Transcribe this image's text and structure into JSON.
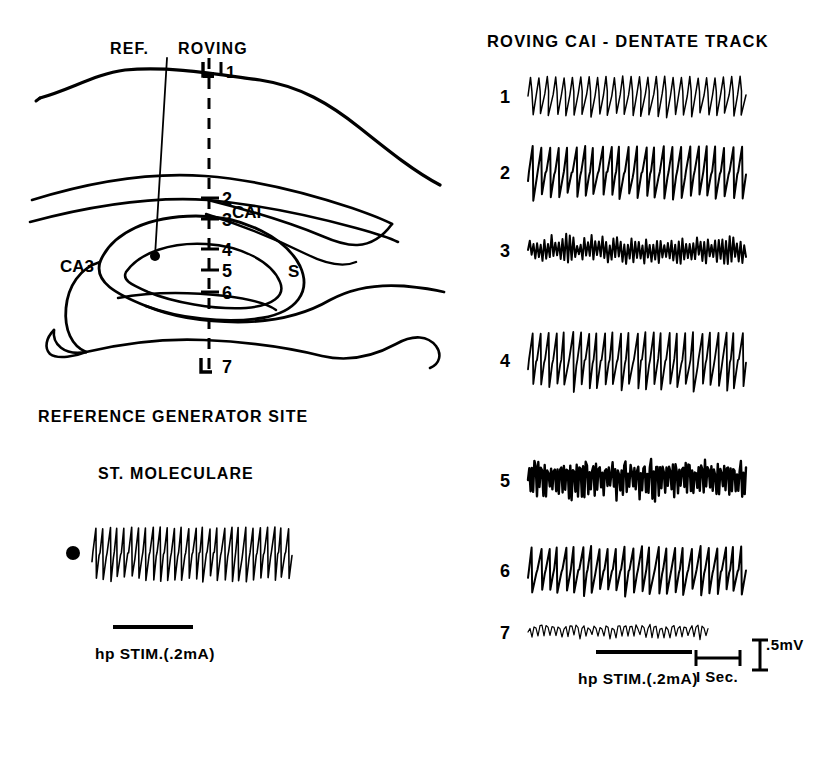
{
  "figure": {
    "type": "electrophysiology-recording-figure",
    "background": "#ffffff",
    "ink": "#000000"
  },
  "anatomy_panel": {
    "title_ref": "REF.",
    "title_roving": "ROVING",
    "region_labels": [
      {
        "id": "ca1",
        "text": "CAI",
        "x": 232,
        "y": 218
      },
      {
        "id": "ca3",
        "text": "CA3",
        "x": 60,
        "y": 272
      },
      {
        "id": "subiculum",
        "text": "S",
        "x": 288,
        "y": 277
      }
    ],
    "electrode_depths": [
      {
        "n": "1",
        "x": 210,
        "y": 72
      },
      {
        "n": "2",
        "x": 213,
        "y": 198
      },
      {
        "n": "3",
        "x": 213,
        "y": 219
      },
      {
        "n": "4",
        "x": 213,
        "y": 249
      },
      {
        "n": "5",
        "x": 213,
        "y": 270
      },
      {
        "n": "6",
        "x": 213,
        "y": 292
      },
      {
        "n": "7",
        "x": 213,
        "y": 366
      }
    ],
    "reference_site_marker": {
      "x": 155,
      "y": 256,
      "r": 5
    }
  },
  "reference_panel": {
    "heading": "REFERENCE GENERATOR SITE",
    "subheading": "ST. MOLECULARE",
    "stim_label": "hp STIM.(.2mA)",
    "marker_dot": {
      "x": 73,
      "y": 553,
      "r": 7
    },
    "stim_bar": {
      "x": 113,
      "y": 625,
      "w": 80,
      "h": 4
    }
  },
  "track_panel": {
    "title": "ROVING CAI - DENTATE TRACK",
    "stim_label": "hp STIM.(.2mA)",
    "time_scale_label": "I Sec.",
    "volt_scale_label": ".5mV",
    "stim_bar": {
      "x": 596,
      "y": 650,
      "w": 96,
      "h": 4
    },
    "trace_labels": [
      "1",
      "2",
      "3",
      "4",
      "5",
      "6",
      "7"
    ]
  },
  "chart_data": {
    "type": "line",
    "title": "ROVING CAI - DENTATE TRACK",
    "xlabel": "time",
    "ylabel": "field potential",
    "x_scale": {
      "label": "I Sec.",
      "pixels": 44,
      "value": 1,
      "unit": "s"
    },
    "y_scale": {
      "label": ".5mV",
      "pixels": 30,
      "value": 0.5,
      "unit": "mV"
    },
    "stimulus": {
      "label": "hp STIM.(.2mA)",
      "current_mA": 0.2,
      "site": "hippocampus"
    },
    "series": [
      {
        "name": "1",
        "depth": 1,
        "x": 528,
        "y": 96,
        "width": 218,
        "amp": 20,
        "cycles": 26,
        "style": "theta-sharp",
        "jitter": 0.3,
        "thickness": 1.5,
        "description": "regular large-amplitude theta rhythm, sharp negative-going spikes"
      },
      {
        "name": "2",
        "depth": 2,
        "x": 528,
        "y": 172,
        "width": 218,
        "amp": 26,
        "cycles": 25,
        "style": "sawtooth-down",
        "jitter": 0.22,
        "thickness": 2.0,
        "description": "high amplitude sawtooth, steep falling phase"
      },
      {
        "name": "3",
        "depth": 3,
        "x": 528,
        "y": 250,
        "width": 218,
        "amp": 17,
        "cycles": 30,
        "style": "noisy-theta",
        "jitter": 0.75,
        "thickness": 2.0,
        "description": "irregular mixed-frequency activity, reduced rhythmicity"
      },
      {
        "name": "4",
        "depth": 4,
        "x": 528,
        "y": 360,
        "width": 218,
        "amp": 28,
        "cycles": 27,
        "style": "sawtooth-down",
        "jitter": 0.18,
        "thickness": 1.8,
        "description": "large sawtooth theta, maximal amplitude"
      },
      {
        "name": "5",
        "depth": 5,
        "x": 528,
        "y": 480,
        "width": 218,
        "amp": 22,
        "cycles": 34,
        "style": "dense-noise",
        "jitter": 0.95,
        "thickness": 2.4,
        "description": "dense high-frequency noisy burst activity"
      },
      {
        "name": "6",
        "depth": 6,
        "x": 528,
        "y": 570,
        "width": 218,
        "amp": 24,
        "cycles": 26,
        "style": "sawtooth-down",
        "jitter": 0.35,
        "thickness": 2.0,
        "description": "sawtooth theta returning, moderate amplitude"
      },
      {
        "name": "7",
        "depth": 7,
        "x": 528,
        "y": 632,
        "width": 180,
        "amp": 8,
        "cycles": 30,
        "style": "low-amplitude",
        "jitter": 0.55,
        "thickness": 1.2,
        "description": "small irregular low-voltage activity below hippocampus"
      }
    ],
    "reference_series": {
      "name": "ST. MOLECULARE",
      "x": 92,
      "y": 553,
      "width": 200,
      "amp": 26,
      "cycles": 28,
      "style": "sawtooth-down",
      "jitter": 0.2,
      "thickness": 1.6,
      "description": "reference generator site, stratum moleculare, large regular theta"
    }
  }
}
